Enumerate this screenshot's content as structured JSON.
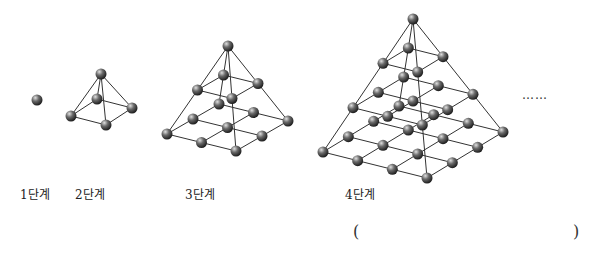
{
  "figure": {
    "stages": [
      {
        "label": "1단계",
        "layers": 1,
        "ball_count": 1
      },
      {
        "label": "2단계",
        "layers": 2,
        "ball_count": 5
      },
      {
        "label": "3단계",
        "layers": 3,
        "ball_count": 14
      },
      {
        "label": "4단계",
        "layers": 4,
        "ball_count": 30
      }
    ],
    "continuation": "……",
    "answer_blank": {
      "open": "(",
      "close": ")"
    }
  },
  "colors": {
    "ball": "#555555",
    "ball_highlight": "#d8d8d8",
    "rod": "#333333",
    "text": "#222222"
  }
}
